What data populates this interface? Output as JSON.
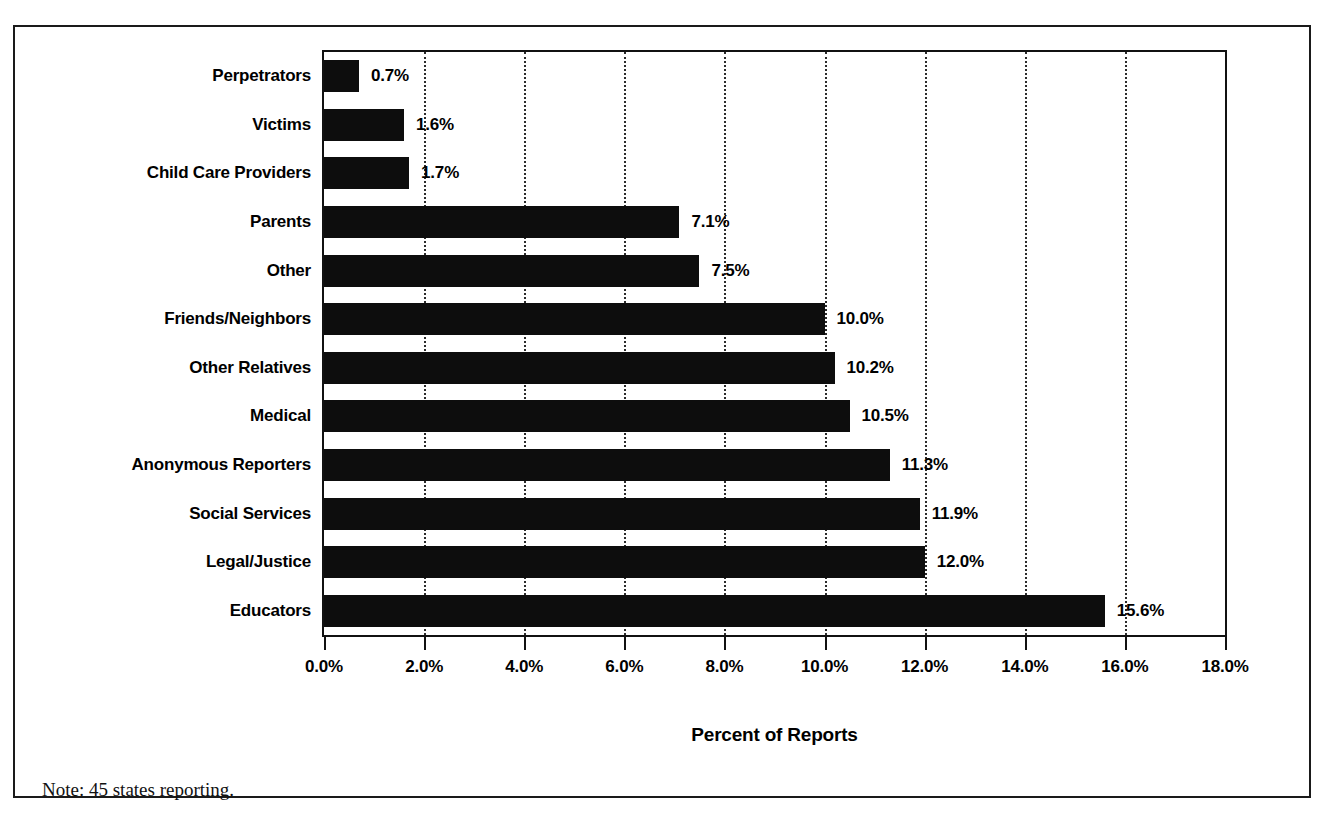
{
  "chart_data": {
    "type": "bar",
    "orientation": "horizontal",
    "title": "",
    "xlabel": "Percent of Reports",
    "ylabel": "",
    "xlim": [
      0,
      18
    ],
    "grid": "vertical-dotted",
    "legend": "none",
    "bar_color": "#0d0d0d",
    "categories": [
      "Perpetrators",
      "Victims",
      "Child Care Providers",
      "Parents",
      "Other",
      "Friends/Neighbors",
      "Other Relatives",
      "Medical",
      "Anonymous Reporters",
      "Social Services",
      "Legal/Justice",
      "Educators"
    ],
    "values": [
      0.7,
      1.6,
      1.7,
      7.1,
      7.5,
      10.0,
      10.2,
      10.5,
      11.3,
      11.9,
      12.0,
      15.6
    ],
    "value_labels": [
      "0.7%",
      "1.6%",
      "1.7%",
      "7.1%",
      "7.5%",
      "10.0%",
      "10.2%",
      "10.5%",
      "11.3%",
      "11.9%",
      "12.0%",
      "15.6%"
    ],
    "xticks": [
      0,
      2,
      4,
      6,
      8,
      10,
      12,
      14,
      16,
      18
    ],
    "xtick_labels": [
      "0.0%",
      "2.0%",
      "4.0%",
      "6.0%",
      "8.0%",
      "10.0%",
      "12.0%",
      "14.0%",
      "16.0%",
      "18.0%"
    ],
    "gridline_values": [
      2,
      4,
      6,
      8,
      10,
      12,
      14,
      16
    ],
    "note": "Note: 45 states reporting."
  }
}
